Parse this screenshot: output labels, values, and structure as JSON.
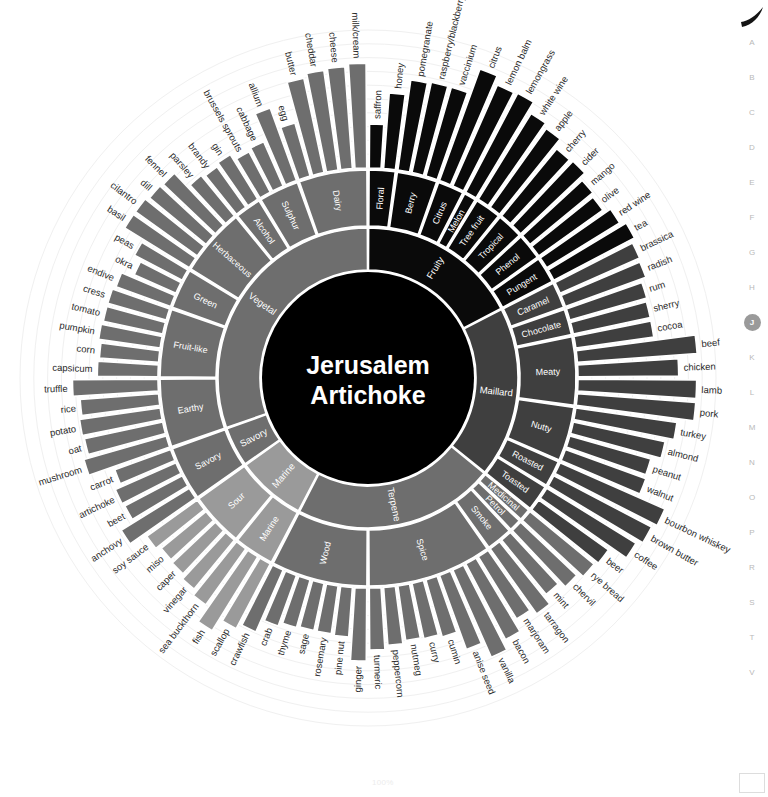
{
  "center": {
    "line1": "Jerusalem",
    "line2": "Artichoke"
  },
  "scale_note": "100%",
  "colors": {
    "ring_black": "#0a0a0a",
    "ring_dark": "#3f3f3f",
    "ring_mid": "#6e6e6e",
    "ring_light": "#9a9a9a",
    "ring_pale": "#bdbdbd",
    "ring_palest": "#d4d4d4",
    "divider": "#ffffff",
    "center_fill": "#000000",
    "index_active": "#9a9a9a",
    "index_inactive": "#b9b9b9",
    "guide": "#f0f0f0"
  },
  "index_rail": {
    "letters": [
      "A",
      "B",
      "C",
      "D",
      "E",
      "F",
      "G",
      "H",
      "J",
      "K",
      "L",
      "M",
      "N",
      "O",
      "P",
      "R",
      "S",
      "T",
      "V"
    ],
    "active": "J"
  },
  "chart_data": {
    "type": "pie",
    "subtitle": "",
    "xlabel": "",
    "ylabel": "",
    "legend_position": "none",
    "grid": true,
    "rings": [
      "category",
      "family",
      "ingredient"
    ],
    "value_range": [
      0,
      100
    ],
    "categories": [
      {
        "name": "Fruity",
        "shade": "ring_black",
        "families": [
          {
            "name": "Floral",
            "items": [
              {
                "label": "saffron",
                "value": 32
              },
              {
                "label": "honey",
                "value": 55
              }
            ]
          },
          {
            "name": "Berry",
            "items": [
              {
                "label": "pomegranate",
                "value": 66
              },
              {
                "label": "raspberry/blackberry",
                "value": 67
              },
              {
                "label": "vaccinium",
                "value": 67
              }
            ]
          },
          {
            "name": "Citrus",
            "items": [
              {
                "label": "citrus",
                "value": 86
              },
              {
                "label": "lemon balm",
                "value": 80
              }
            ]
          },
          {
            "name": "Melon",
            "items": [
              {
                "label": "lemongrass",
                "value": 81
              }
            ]
          },
          {
            "name": "Tree fruit",
            "items": [
              {
                "label": "white wine",
                "value": 73
              },
              {
                "label": "apple",
                "value": 70
              }
            ]
          },
          {
            "name": "Tropical",
            "items": [
              {
                "label": "cherry",
                "value": 63
              },
              {
                "label": "cider",
                "value": 64
              }
            ]
          },
          {
            "name": "Phenol",
            "items": [
              {
                "label": "mango",
                "value": 59
              },
              {
                "label": "olive",
                "value": 57
              }
            ]
          },
          {
            "name": "Pungent",
            "items": [
              {
                "label": "red wine",
                "value": 62
              },
              {
                "label": "tea",
                "value": 66
              }
            ]
          }
        ]
      },
      {
        "name": "Maillard",
        "shade": "ring_dark",
        "families": [
          {
            "name": "Caramel",
            "items": [
              {
                "label": "brassica",
                "value": 63
              },
              {
                "label": "radish",
                "value": 62
              }
            ]
          },
          {
            "name": "Chocolate",
            "items": [
              {
                "label": "rum",
                "value": 58
              },
              {
                "label": "sherry",
                "value": 57
              }
            ]
          },
          {
            "name": "Meaty",
            "items": [
              {
                "label": "cocoa",
                "value": 57
              },
              {
                "label": "beef",
                "value": 87
              },
              {
                "label": "chicken",
                "value": 73
              },
              {
                "label": "lamb",
                "value": 86
              },
              {
                "label": "pork",
                "value": 86
              }
            ]
          },
          {
            "name": "Nutty",
            "items": [
              {
                "label": "turkey",
                "value": 74
              },
              {
                "label": "almond",
                "value": 68
              },
              {
                "label": "peanut",
                "value": 61
              },
              {
                "label": "walnut",
                "value": 62
              }
            ]
          },
          {
            "name": "Roasted",
            "items": [
              {
                "label": "bourbon whiskey",
                "value": 83
              },
              {
                "label": "brown butter",
                "value": 80
              }
            ]
          },
          {
            "name": "Toasted",
            "items": [
              {
                "label": "coffee",
                "value": 76
              },
              {
                "label": "beer",
                "value": 62
              }
            ]
          }
        ]
      },
      {
        "name": "Terpene",
        "shade": "ring_mid",
        "families": [
          {
            "name": "Medicinal",
            "items": [
              {
                "label": "rye bread",
                "value": 60
              }
            ]
          },
          {
            "name": "Petrol",
            "items": [
              {
                "label": "chervil",
                "value": 56
              }
            ]
          },
          {
            "name": "Smoke",
            "items": [
              {
                "label": "mint",
                "value": 51
              },
              {
                "label": "tarragon",
                "value": 58
              }
            ]
          },
          {
            "name": "Spice",
            "items": [
              {
                "label": "marjoram",
                "value": 53
              },
              {
                "label": "bacon",
                "value": 62
              },
              {
                "label": "vanilla",
                "value": 69
              },
              {
                "label": "anise seed",
                "value": 57
              },
              {
                "label": "cumin",
                "value": 43
              },
              {
                "label": "curry",
                "value": 41
              },
              {
                "label": "nutmeg",
                "value": 40
              },
              {
                "label": "peppercorn",
                "value": 42
              },
              {
                "label": "turmeric",
                "value": 45
              }
            ]
          },
          {
            "name": "Wood",
            "items": [
              {
                "label": "ginger",
                "value": 53
              },
              {
                "label": "pine nut",
                "value": 36
              },
              {
                "label": "rosemary",
                "value": 35
              },
              {
                "label": "sage",
                "value": 35
              },
              {
                "label": "thyme",
                "value": 36
              },
              {
                "label": "crab",
                "value": 39
              },
              {
                "label": "crawfish",
                "value": 49
              }
            ]
          }
        ]
      },
      {
        "name": "Marine",
        "shade": "ring_light",
        "families": [
          {
            "name": "Marine",
            "items": [
              {
                "label": "scallop",
                "value": 53
              },
              {
                "label": "fish",
                "value": 63
              },
              {
                "label": "sea buckthorn",
                "value": 50
              }
            ]
          },
          {
            "name": "Sour",
            "items": [
              {
                "label": "vinegar",
                "value": 46
              },
              {
                "label": "caper",
                "value": 43
              },
              {
                "label": "miso",
                "value": 42
              },
              {
                "label": "soy sauce",
                "value": 45
              }
            ]
          }
        ]
      },
      {
        "name": "Savory",
        "shade": "ring_mid",
        "families": [
          {
            "name": "Savory",
            "items": [
              {
                "label": "anchovy",
                "value": 58
              },
              {
                "label": "beet",
                "value": 47
              },
              {
                "label": "artichoke",
                "value": 48
              },
              {
                "label": "carrot",
                "value": 43
              }
            ]
          }
        ]
      },
      {
        "name": "Vegetal",
        "shade": "ring_mid",
        "families": [
          {
            "name": "Earthy",
            "items": [
              {
                "label": "mushroom",
                "value": 62
              },
              {
                "label": "oat",
                "value": 58
              },
              {
                "label": "potato",
                "value": 59
              },
              {
                "label": "rice",
                "value": 57
              },
              {
                "label": "truffle",
                "value": 62
              }
            ]
          },
          {
            "name": "Fruit-like",
            "items": [
              {
                "label": "capsicum",
                "value": 44
              },
              {
                "label": "corn",
                "value": 43
              },
              {
                "label": "pumpkin",
                "value": 45
              },
              {
                "label": "tomato",
                "value": 44
              },
              {
                "label": "cress",
                "value": 44
              }
            ]
          },
          {
            "name": "Green",
            "items": [
              {
                "label": "endive",
                "value": 42
              },
              {
                "label": "okra",
                "value": 33
              },
              {
                "label": "peas",
                "value": 39
              }
            ]
          },
          {
            "name": "Herbaceous",
            "items": [
              {
                "label": "basil",
                "value": 55
              },
              {
                "label": "cilantro",
                "value": 55
              },
              {
                "label": "dill",
                "value": 53
              },
              {
                "label": "fennel",
                "value": 52
              },
              {
                "label": "parsley",
                "value": 38
              }
            ]
          },
          {
            "name": "Alcohol",
            "items": [
              {
                "label": "brandy",
                "value": 36
              },
              {
                "label": "gin",
                "value": 38
              }
            ]
          },
          {
            "name": "Sulphur",
            "items": [
              {
                "label": "brussels sprouts",
                "value": 33
              },
              {
                "label": "cabbage",
                "value": 35
              },
              {
                "label": "allium",
                "value": 56
              }
            ]
          },
          {
            "name": "Dairy",
            "items": [
              {
                "label": "egg",
                "value": 40
              },
              {
                "label": "butter",
                "value": 70
              },
              {
                "label": "cheddar",
                "value": 73
              },
              {
                "label": "cheese",
                "value": 74
              },
              {
                "label": "milk/cream",
                "value": 76
              }
            ]
          }
        ]
      }
    ]
  }
}
